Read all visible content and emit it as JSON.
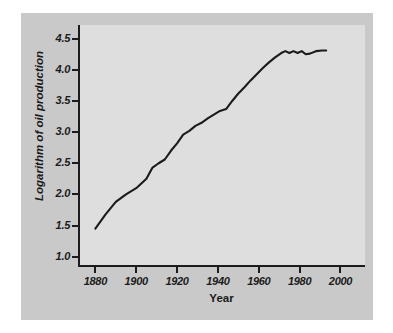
{
  "chart_data": {
    "type": "line",
    "title": "",
    "xlabel": "Year",
    "ylabel": "Logarithm of oil production",
    "xlim": [
      1872,
      2012
    ],
    "ylim": [
      0.85,
      4.72
    ],
    "grid": false,
    "legend": null,
    "line_color": "#1b1b1b",
    "panel_color": "#dedede",
    "figure_color": "#c9c9c9",
    "xticks": [
      1880,
      1900,
      1920,
      1940,
      1960,
      1980,
      2000
    ],
    "xtick_labels": [
      "1880",
      "1900",
      "1920",
      "1940",
      "1960",
      "1980",
      "2000"
    ],
    "yticks": [
      1.0,
      1.5,
      2.0,
      2.5,
      3.0,
      3.5,
      4.0,
      4.5
    ],
    "ytick_labels": [
      "1.0",
      "1.5",
      "2.0",
      "2.5",
      "3.0",
      "3.5",
      "4.0",
      "4.5"
    ],
    "series": [
      {
        "name": "Logarithm of oil production",
        "x": [
          1880,
          1885,
          1890,
          1895,
          1900,
          1905,
          1908,
          1911,
          1914,
          1917,
          1920,
          1923,
          1926,
          1929,
          1932,
          1935,
          1938,
          1941,
          1944,
          1947,
          1950,
          1953,
          1956,
          1959,
          1962,
          1965,
          1968,
          1971,
          1973,
          1975,
          1977,
          1979,
          1981,
          1983,
          1985,
          1988,
          1991,
          1993
        ],
        "y": [
          1.45,
          1.68,
          1.88,
          2.0,
          2.1,
          2.25,
          2.43,
          2.5,
          2.56,
          2.7,
          2.82,
          2.96,
          3.02,
          3.1,
          3.15,
          3.22,
          3.28,
          3.34,
          3.37,
          3.5,
          3.62,
          3.72,
          3.83,
          3.93,
          4.03,
          4.12,
          4.2,
          4.27,
          4.3,
          4.27,
          4.3,
          4.27,
          4.3,
          4.25,
          4.26,
          4.3,
          4.31,
          4.31
        ]
      }
    ]
  },
  "axes": {
    "x_label": "Year",
    "y_label": "Logarithm of oil production"
  }
}
